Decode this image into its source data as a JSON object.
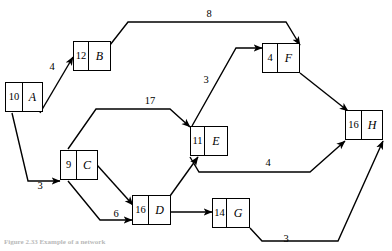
{
  "figure": {
    "type": "directed-graph-diagram",
    "caption": "Figure 2.33 Example of a network",
    "background_color": "#ffffff",
    "stroke_color": "#000000"
  },
  "nodes": [
    {
      "id": "A",
      "cost": "10",
      "label": "A",
      "x": 5,
      "y": 82,
      "w": 38,
      "h": 30,
      "cost_w": 17
    },
    {
      "id": "B",
      "cost": "12",
      "label": "B",
      "x": 73,
      "y": 41,
      "w": 38,
      "h": 30,
      "cost_w": 15
    },
    {
      "id": "C",
      "cost": "9",
      "label": "C",
      "x": 60,
      "y": 150,
      "w": 38,
      "h": 30,
      "cost_w": 16
    },
    {
      "id": "D",
      "cost": "16",
      "label": "D",
      "x": 132,
      "y": 195,
      "w": 39,
      "h": 30,
      "cost_w": 16
    },
    {
      "id": "E",
      "cost": "11",
      "label": "E",
      "x": 190,
      "y": 126,
      "w": 38,
      "h": 30,
      "cost_w": 14
    },
    {
      "id": "F",
      "cost": "4",
      "label": "F",
      "x": 262,
      "y": 43,
      "w": 38,
      "h": 30,
      "cost_w": 15
    },
    {
      "id": "G",
      "cost": "14",
      "label": "G",
      "x": 212,
      "y": 198,
      "w": 38,
      "h": 30,
      "cost_w": 14
    },
    {
      "id": "H",
      "cost": "16",
      "label": "H",
      "x": 345,
      "y": 110,
      "w": 38,
      "h": 30,
      "cost_w": 16
    }
  ],
  "edges": [
    {
      "id": "A-B",
      "from": "A",
      "to": "B",
      "weight": "4",
      "label_x": 52,
      "label_y": 67,
      "path": "M 40,113 L 73,57",
      "arrow": true
    },
    {
      "id": "B-F",
      "from": "B",
      "to": "F",
      "weight": "8",
      "label_x": 209,
      "label_y": 14,
      "path": "M 110,45 L 128,22 L 286,22 L 300,45",
      "arrow": true
    },
    {
      "id": "A-C",
      "from": "A",
      "to": "C",
      "weight": "3",
      "label_x": 40,
      "label_y": 186,
      "path": "M 12,113 L 28,181 L 45,181 L 60,181",
      "arrow": true
    },
    {
      "id": "C-E",
      "from": "C",
      "to": "E",
      "weight": "17",
      "label_x": 150,
      "label_y": 101,
      "path": "M 68,149 L 96,109 L 170,109 L 190,127",
      "arrow": true
    },
    {
      "id": "C-D",
      "from": "C",
      "to": "D",
      "weight": "",
      "label_x": 0,
      "label_y": 0,
      "path": "M 97,165 L 133,205",
      "arrow": true
    },
    {
      "id": "C-D2",
      "from": "C",
      "to": "D",
      "weight": "6",
      "label_x": 116,
      "label_y": 214,
      "path": "M 68,181 L 100,220 L 132,220",
      "arrow": true
    },
    {
      "id": "D-E",
      "from": "D",
      "to": "E",
      "weight": "",
      "label_x": 0,
      "label_y": 0,
      "path": "M 170,196 L 198,157",
      "arrow": true
    },
    {
      "id": "D-G",
      "from": "D",
      "to": "G",
      "weight": "",
      "label_x": 0,
      "label_y": 0,
      "path": "M 171,212 L 212,212",
      "arrow": true
    },
    {
      "id": "E-F",
      "from": "E",
      "to": "F",
      "weight": "3",
      "label_x": 206,
      "label_y": 80,
      "path": "M 192,126 L 236,48 L 262,48",
      "arrow": true
    },
    {
      "id": "E-H",
      "from": "E",
      "to": "H",
      "weight": "4",
      "label_x": 268,
      "label_y": 163,
      "path": "M 190,157 L 199,172 L 310,172 L 345,141",
      "arrow": true
    },
    {
      "id": "F-H",
      "from": "F",
      "to": "H",
      "weight": "",
      "label_x": 0,
      "label_y": 0,
      "path": "M 300,73 L 348,111",
      "arrow": true
    },
    {
      "id": "G-H",
      "from": "G",
      "to": "H",
      "weight": "3",
      "label_x": 286,
      "label_y": 239,
      "path": "M 250,228 L 262,241 L 338,241 L 383,141",
      "arrow": true
    }
  ]
}
